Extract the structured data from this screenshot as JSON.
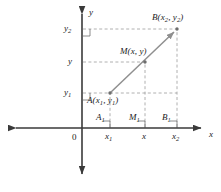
{
  "figure": {
    "axes": {
      "x_axis_label": "x",
      "y_axis_label": "y",
      "origin_label": "0"
    },
    "colors": {
      "axis": "#3a3a3a",
      "segment": "#8a8a8a",
      "dashed": "#9a9a9a",
      "text": "#1a1a1a",
      "background": "#ffffff"
    },
    "points": [
      {
        "id": "A",
        "name": "A",
        "label": "A(x",
        "sub1": "1",
        "mid": ", y",
        "sub2": "1",
        "close": ")",
        "px": 110,
        "py": 93
      },
      {
        "id": "M",
        "name": "M",
        "label": "M(x, y)",
        "px": 145,
        "py": 62
      },
      {
        "id": "B",
        "name": "B",
        "label": "B(x",
        "sub1": "2",
        "mid": ", y",
        "sub2": "2",
        "close": ")",
        "px": 177,
        "py": 29
      }
    ],
    "y_ticks": [
      {
        "base": "y",
        "sub": "2",
        "py": 29
      },
      {
        "base": "y",
        "sub": "",
        "py": 62
      },
      {
        "base": "y",
        "sub": "1",
        "py": 93
      }
    ],
    "x_ticks": [
      {
        "base": "x",
        "sub": "1",
        "px": 110
      },
      {
        "base": "x",
        "sub": "",
        "px": 145
      },
      {
        "base": "x",
        "sub": "2",
        "px": 177
      }
    ],
    "foot_labels": [
      {
        "base": "A",
        "sub": "1",
        "px": 110
      },
      {
        "base": "M",
        "sub": "1",
        "px": 145
      },
      {
        "base": "B",
        "sub": "1",
        "px": 177
      }
    ],
    "geometry": {
      "y_axis_x": 82,
      "x_axis_y": 128,
      "y_axis_top": 8,
      "y_axis_bottom": 180,
      "x_axis_left": 10,
      "x_axis_right": 207
    }
  }
}
